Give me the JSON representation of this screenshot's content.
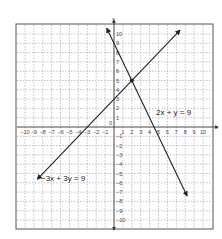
{
  "chart_data": {
    "type": "line",
    "title": "",
    "xlabel": "x",
    "ylabel": "y",
    "xlim": [
      -10,
      10
    ],
    "ylim": [
      -10,
      10
    ],
    "grid": true,
    "grid_style": "dashed",
    "x_ticks": [
      -10,
      -9,
      -8,
      -7,
      -6,
      -5,
      -4,
      -3,
      -2,
      -1,
      1,
      2,
      3,
      4,
      5,
      6,
      7,
      8,
      9,
      10
    ],
    "y_ticks": [
      -10,
      -9,
      -8,
      -7,
      -6,
      -5,
      -4,
      -3,
      -2,
      -1,
      1,
      2,
      3,
      4,
      5,
      6,
      7,
      8,
      9,
      10
    ],
    "origin_label": "0",
    "series": [
      {
        "name": "2x + y = 9",
        "label": "2x + y = 9",
        "equation": "y = 9 - 2x",
        "x": [
          -0.8,
          8.2
        ],
        "y": [
          10.6,
          -7.4
        ],
        "arrows": "both",
        "label_position": [
          4.7,
          1.2
        ]
      },
      {
        "name": "-3x + 3y = 9",
        "label": "−3x + 3y = 9",
        "equation": "y = x + 3",
        "x": [
          -8.6,
          7.4
        ],
        "y": [
          -5.6,
          10.4
        ],
        "arrows": "both",
        "label_position": [
          -8.2,
          -6.0
        ]
      }
    ],
    "annotations": [
      {
        "type": "point",
        "x": 2,
        "y": 5,
        "label": "intersection"
      }
    ]
  },
  "labels": {
    "x_axis": "x",
    "y_axis": "y",
    "origin": "0",
    "eq1": "2x + y = 9",
    "eq2": "−3x + 3y = 9"
  },
  "colors": {
    "line": "#222222",
    "grid": "#9a9a9a",
    "frame": "#555555",
    "axis": "#333333"
  }
}
